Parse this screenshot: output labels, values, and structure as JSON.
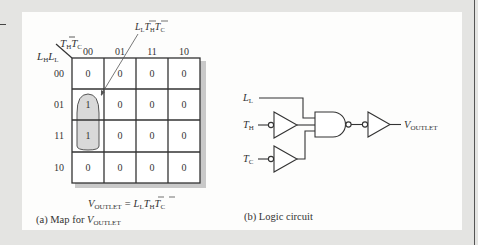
{
  "kmap": {
    "row_var_label": "L",
    "row_var_sub1": "H",
    "row_var_sub2": "L",
    "col_var_label": "T",
    "col_var_sub1": "H",
    "col_var_sub2": "C",
    "column_headers": [
      "00",
      "01",
      "11",
      "10"
    ],
    "row_headers": [
      "00",
      "01",
      "11",
      "10"
    ],
    "cells": [
      [
        "0",
        "0",
        "0",
        "0"
      ],
      [
        "1",
        "0",
        "0",
        "0"
      ],
      [
        "1",
        "0",
        "0",
        "0"
      ],
      [
        "0",
        "0",
        "0",
        "0"
      ]
    ],
    "group_annotation": {
      "L": "L",
      "L_sub": "L",
      "TH": "T",
      "TH_sub": "H",
      "TC": "T",
      "TC_sub": "C",
      "text": "L_L T̄_H T̄_C"
    },
    "equation": {
      "lhs": "V",
      "lhs_sub": "OUTLET",
      "eq": "=",
      "r1": "L",
      "r1_sub": "L",
      "r2": "T",
      "r2_sub": "H",
      "r3": "T",
      "r3_sub": "C"
    },
    "caption_prefix": "(a)  Map for ",
    "caption_var": "V",
    "caption_sub": "OUTLET",
    "group_fill": "#d9d9d9"
  },
  "circuit": {
    "inputs": [
      {
        "name": "L",
        "sub": "L"
      },
      {
        "name": "T",
        "sub": "H"
      },
      {
        "name": "T",
        "sub": "C"
      }
    ],
    "output": {
      "name": "V",
      "sub": "OUTLET"
    },
    "caption": "(b)  Logic circuit"
  }
}
